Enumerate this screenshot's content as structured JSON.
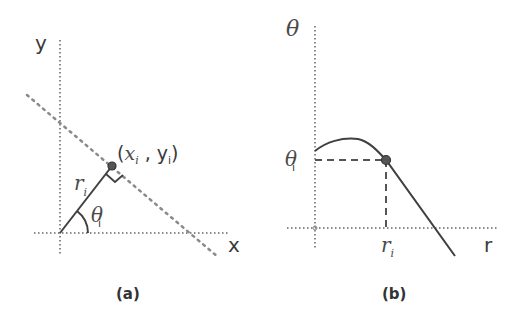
{
  "panel_a": {
    "caption": "(a)",
    "x_axis_label": "x",
    "y_axis_label": "y",
    "point_label_open": "(",
    "point_label_x": "x",
    "point_label_x_sub": "i",
    "point_label_sep": " , ",
    "point_label_y": "y",
    "point_label_y_sub": "i",
    "point_label_close": ")",
    "radius_label": "r",
    "radius_label_sub": "i",
    "angle_label": "θ",
    "angle_label_sub": "i"
  },
  "panel_b": {
    "caption": "(b)",
    "x_axis_label": "r",
    "y_axis_label": "θ",
    "theta_tick_label": "θ",
    "theta_tick_sub": "i",
    "r_tick_label": "r",
    "r_tick_sub": "i"
  },
  "colors": {
    "line": "#404040",
    "dotted": "#8a8a8a",
    "text": "#3a3a3a"
  }
}
